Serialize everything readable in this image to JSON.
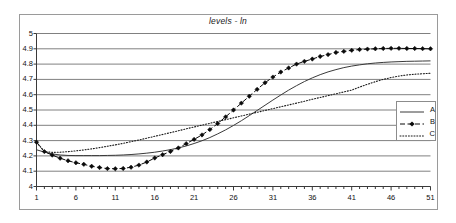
{
  "chart_data": {
    "type": "line",
    "title": "levels - ln",
    "xlabel": "",
    "ylabel": "",
    "xlim": [
      1,
      51
    ],
    "ylim": [
      4,
      5
    ],
    "grid": true,
    "grid_axis": "y",
    "legend_position": "right",
    "xticks": [
      "1",
      "6",
      "11",
      "16",
      "21",
      "26",
      "31",
      "36",
      "41",
      "46",
      "51"
    ],
    "xtick_values": [
      1,
      6,
      11,
      16,
      21,
      26,
      31,
      36,
      41,
      46,
      51
    ],
    "yticks": [
      "4",
      "4.1",
      "4.2",
      "4.3",
      "4.4",
      "4.5",
      "4.6",
      "4.7",
      "4.8",
      "4.9",
      "5"
    ],
    "ytick_values": [
      4,
      4.1,
      4.2,
      4.3,
      4.4,
      4.5,
      4.6,
      4.7,
      4.8,
      4.9,
      5
    ],
    "x": [
      1,
      2,
      3,
      4,
      5,
      6,
      7,
      8,
      9,
      10,
      11,
      12,
      13,
      14,
      15,
      16,
      17,
      18,
      19,
      20,
      21,
      22,
      23,
      24,
      25,
      26,
      27,
      28,
      29,
      30,
      31,
      32,
      33,
      34,
      35,
      36,
      37,
      38,
      39,
      40,
      41,
      42,
      43,
      44,
      45,
      46,
      47,
      48,
      49,
      50,
      51
    ],
    "series": [
      {
        "name": "A",
        "style": "solid",
        "marker": "none",
        "color": "#3a3a3a",
        "values": [
          4.24,
          4.225,
          4.213,
          4.206,
          4.203,
          4.202,
          4.202,
          4.202,
          4.202,
          4.203,
          4.204,
          4.206,
          4.209,
          4.213,
          4.218,
          4.224,
          4.232,
          4.241,
          4.252,
          4.265,
          4.281,
          4.299,
          4.32,
          4.344,
          4.37,
          4.399,
          4.43,
          4.463,
          4.497,
          4.531,
          4.565,
          4.598,
          4.63,
          4.659,
          4.686,
          4.71,
          4.731,
          4.749,
          4.764,
          4.777,
          4.787,
          4.795,
          4.802,
          4.807,
          4.811,
          4.814,
          4.816,
          4.818,
          4.819,
          4.82,
          4.821
        ]
      },
      {
        "name": "B",
        "style": "dashed",
        "marker": "diamond",
        "color": "#0a0a0a",
        "values": [
          4.29,
          4.228,
          4.205,
          4.185,
          4.168,
          4.155,
          4.145,
          4.132,
          4.124,
          4.117,
          4.116,
          4.118,
          4.126,
          4.14,
          4.16,
          4.186,
          4.208,
          4.229,
          4.252,
          4.28,
          4.308,
          4.337,
          4.372,
          4.412,
          4.455,
          4.5,
          4.545,
          4.59,
          4.635,
          4.678,
          4.715,
          4.748,
          4.775,
          4.8,
          4.818,
          4.833,
          4.85,
          4.862,
          4.876,
          4.883,
          4.89,
          4.895,
          4.898,
          4.9,
          4.902,
          4.903,
          4.903,
          4.902,
          4.902,
          4.901,
          4.9
        ]
      },
      {
        "name": "C",
        "style": "dotted",
        "marker": "none",
        "color": "#1a1a1a",
        "values": [
          4.29,
          4.228,
          4.223,
          4.224,
          4.228,
          4.233,
          4.239,
          4.246,
          4.254,
          4.263,
          4.272,
          4.282,
          4.293,
          4.304,
          4.316,
          4.328,
          4.34,
          4.352,
          4.364,
          4.377,
          4.389,
          4.401,
          4.413,
          4.425,
          4.437,
          4.449,
          4.461,
          4.473,
          4.485,
          4.497,
          4.509,
          4.521,
          4.533,
          4.545,
          4.557,
          4.57,
          4.582,
          4.594,
          4.606,
          4.618,
          4.63,
          4.65,
          4.668,
          4.685,
          4.7,
          4.712,
          4.722,
          4.729,
          4.734,
          4.737,
          4.74
        ]
      }
    ],
    "legend_entries": [
      {
        "label": "A",
        "style": "solid",
        "marker": "none"
      },
      {
        "label": "B",
        "style": "dashed",
        "marker": "diamond"
      },
      {
        "label": "C",
        "style": "dotted",
        "marker": "none"
      }
    ]
  },
  "colors": {
    "background": "#ffffff",
    "frame_border": "#9a9a9a",
    "gridline": "#808080",
    "axis": "#3a3a3a",
    "text": "#111111"
  }
}
